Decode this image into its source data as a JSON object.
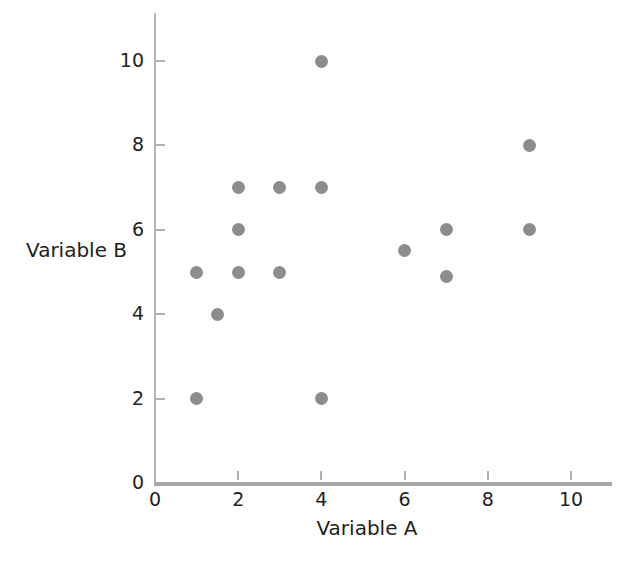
{
  "chart_data": {
    "type": "scatter",
    "title": "",
    "xlabel": "Variable A",
    "ylabel": "Variable B",
    "xlim": [
      0,
      11.1
    ],
    "ylim": [
      0,
      11.1
    ],
    "xticks": [
      0,
      2,
      4,
      6,
      8,
      10
    ],
    "xtick_labels": [
      "0",
      "2",
      "4",
      "6",
      "8",
      "10"
    ],
    "yticks": [
      0,
      2,
      4,
      6,
      8,
      10
    ],
    "ytick_labels": [
      "0",
      "2",
      "4",
      "6",
      "8",
      "10"
    ],
    "grid": false,
    "legend": false,
    "marker_color": "#8d8d8d",
    "axis_color": "#b0b0b0",
    "points": [
      {
        "x": 1,
        "y": 2
      },
      {
        "x": 1,
        "y": 5
      },
      {
        "x": 1.5,
        "y": 4
      },
      {
        "x": 2,
        "y": 5
      },
      {
        "x": 2,
        "y": 6
      },
      {
        "x": 2,
        "y": 7
      },
      {
        "x": 3,
        "y": 5
      },
      {
        "x": 3,
        "y": 7
      },
      {
        "x": 4,
        "y": 2
      },
      {
        "x": 4,
        "y": 7
      },
      {
        "x": 4,
        "y": 10
      },
      {
        "x": 6,
        "y": 5.5
      },
      {
        "x": 7,
        "y": 4.9
      },
      {
        "x": 7,
        "y": 6
      },
      {
        "x": 9,
        "y": 6
      },
      {
        "x": 9,
        "y": 8
      }
    ]
  }
}
